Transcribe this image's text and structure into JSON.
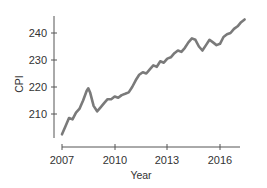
{
  "chart_data": {
    "type": "line",
    "title": "",
    "xlabel": "Year",
    "ylabel": "CPI",
    "xlim": [
      2007,
      2017.5
    ],
    "ylim": [
      202,
      246
    ],
    "x_ticks": [
      2007,
      2010,
      2013,
      2016
    ],
    "y_ticks": [
      210,
      220,
      230,
      240
    ],
    "grid": false,
    "legend": null,
    "line_color": "#7a7a7a",
    "series": [
      {
        "name": "CPI",
        "x": [
          2007.0,
          2007.2,
          2007.4,
          2007.6,
          2007.8,
          2008.0,
          2008.2,
          2008.4,
          2008.5,
          2008.6,
          2008.8,
          2009.0,
          2009.2,
          2009.4,
          2009.6,
          2009.8,
          2010.0,
          2010.2,
          2010.4,
          2010.6,
          2010.8,
          2011.0,
          2011.2,
          2011.4,
          2011.6,
          2011.8,
          2012.0,
          2012.2,
          2012.4,
          2012.6,
          2012.8,
          2013.0,
          2013.2,
          2013.4,
          2013.6,
          2013.8,
          2014.0,
          2014.2,
          2014.4,
          2014.6,
          2014.8,
          2015.0,
          2015.2,
          2015.4,
          2015.6,
          2015.8,
          2016.0,
          2016.2,
          2016.4,
          2016.6,
          2016.8,
          2017.0,
          2017.2,
          2017.4
        ],
        "values": [
          202.5,
          205.5,
          208.5,
          208.0,
          210.5,
          212.0,
          215.0,
          218.5,
          219.5,
          218.0,
          213.0,
          211.0,
          212.5,
          214.0,
          215.5,
          215.5,
          216.5,
          216.0,
          217.0,
          217.5,
          218.0,
          220.0,
          222.5,
          224.5,
          225.5,
          225.0,
          226.5,
          228.0,
          227.5,
          229.5,
          229.0,
          230.5,
          231.0,
          232.5,
          233.5,
          233.0,
          234.5,
          236.5,
          238.0,
          237.5,
          235.0,
          233.5,
          235.5,
          237.5,
          236.5,
          235.5,
          236.0,
          238.5,
          239.5,
          240.0,
          241.5,
          242.5,
          244.0,
          245.0
        ]
      }
    ]
  },
  "axes": {
    "x_label": "Year",
    "y_label": "CPI",
    "x_tick_labels": [
      "2007",
      "2010",
      "2013",
      "2016"
    ],
    "y_tick_labels": [
      "240",
      "230",
      "220",
      "210"
    ]
  }
}
